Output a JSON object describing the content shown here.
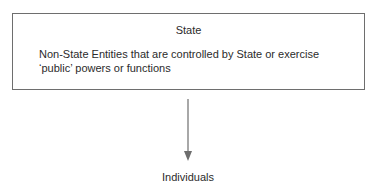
{
  "diagram": {
    "top_box": {
      "title": "State",
      "body": "Non-State Entities that are controlled by State or exercise ‘public’ powers or functions"
    },
    "arrow": {
      "direction": "down",
      "color": "#6e6e6e"
    },
    "bottom_node": {
      "label": "Individuals"
    }
  }
}
